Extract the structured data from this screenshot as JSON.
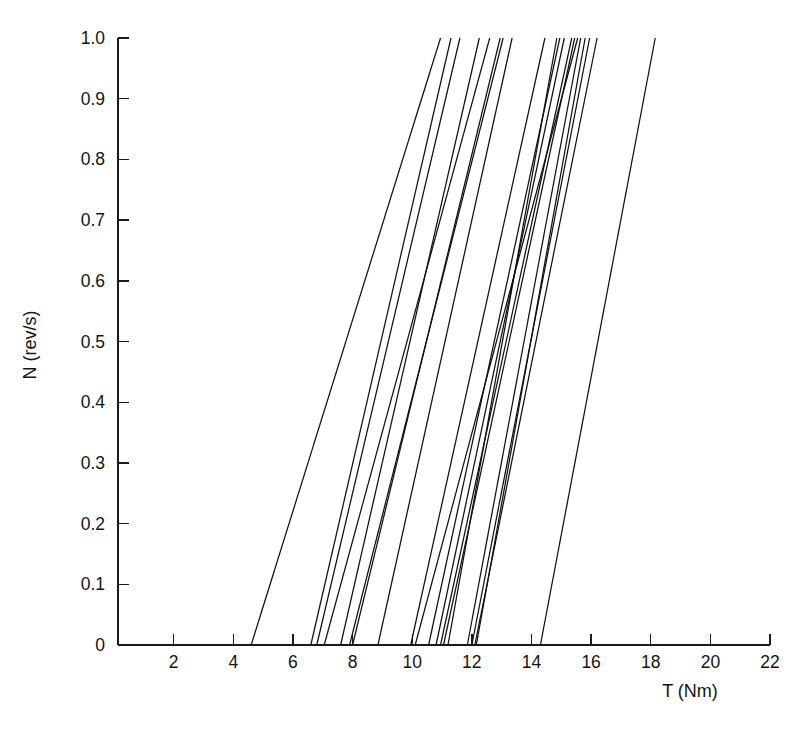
{
  "chart_data": {
    "type": "line",
    "title": "",
    "xlabel": "T (Nm)",
    "ylabel": "N (rev/s)",
    "xlim": [
      0,
      22
    ],
    "ylim": [
      0,
      1.0
    ],
    "grid": false,
    "legend": "none",
    "xticks": [
      2,
      4,
      6,
      8,
      10,
      12,
      14,
      16,
      18,
      20,
      22
    ],
    "xtick_labels": [
      "2",
      "4",
      "6",
      "8",
      "10",
      "12",
      "14",
      "16",
      "18",
      "20",
      "22"
    ],
    "yticks": [
      0,
      0.1,
      0.2,
      0.3,
      0.4,
      0.5,
      0.6,
      0.7,
      0.8,
      0.9,
      1.0
    ],
    "ytick_labels": [
      "0",
      "0.1",
      "0.2",
      "0.3",
      "0.4",
      "0.5",
      "0.6",
      "0.7",
      "0.8",
      "0.9",
      "1.0"
    ],
    "line_color": "#111111",
    "axis_color": "#1a1a1a",
    "series": [
      {
        "name": "line-01",
        "x": [
          4.6,
          10.95
        ],
        "y": [
          0,
          1.0
        ]
      },
      {
        "name": "line-02",
        "x": [
          6.6,
          11.3
        ],
        "y": [
          0,
          1.0
        ]
      },
      {
        "name": "line-03",
        "x": [
          6.8,
          11.6
        ],
        "y": [
          0,
          1.0
        ]
      },
      {
        "name": "line-04",
        "x": [
          7.05,
          12.6
        ],
        "y": [
          0,
          1.0
        ]
      },
      {
        "name": "line-05",
        "x": [
          7.6,
          12.25
        ],
        "y": [
          0,
          1.0
        ]
      },
      {
        "name": "line-06",
        "x": [
          7.9,
          13.05
        ],
        "y": [
          0,
          1.0
        ]
      },
      {
        "name": "line-07",
        "x": [
          8.0,
          12.95
        ],
        "y": [
          0,
          1.0
        ]
      },
      {
        "name": "line-08",
        "x": [
          8.85,
          13.35
        ],
        "y": [
          0,
          1.0
        ]
      },
      {
        "name": "line-09",
        "x": [
          9.95,
          14.45
        ],
        "y": [
          0,
          1.0
        ]
      },
      {
        "name": "line-10",
        "x": [
          10.55,
          14.95
        ],
        "y": [
          0,
          1.0
        ]
      },
      {
        "name": "line-11",
        "x": [
          10.8,
          15.1
        ],
        "y": [
          0,
          1.0
        ]
      },
      {
        "name": "line-12",
        "x": [
          10.95,
          15.35
        ],
        "y": [
          0,
          1.0
        ]
      },
      {
        "name": "line-13",
        "x": [
          11.05,
          15.45
        ],
        "y": [
          0,
          1.0
        ]
      },
      {
        "name": "line-14",
        "x": [
          11.2,
          14.85
        ],
        "y": [
          0,
          1.0
        ]
      },
      {
        "name": "line-15",
        "x": [
          11.85,
          15.65
        ],
        "y": [
          0,
          1.0
        ]
      },
      {
        "name": "line-16",
        "x": [
          12.0,
          15.95
        ],
        "y": [
          0,
          1.0
        ]
      },
      {
        "name": "line-17",
        "x": [
          12.1,
          16.2
        ],
        "y": [
          0,
          1.0
        ]
      },
      {
        "name": "line-18",
        "x": [
          10.1,
          15.55
        ],
        "y": [
          0,
          1.0
        ]
      },
      {
        "name": "line-19",
        "x": [
          12.15,
          15.8
        ],
        "y": [
          0,
          1.0
        ]
      },
      {
        "name": "line-20",
        "x": [
          14.3,
          18.15
        ],
        "y": [
          0,
          1.0
        ]
      }
    ]
  }
}
